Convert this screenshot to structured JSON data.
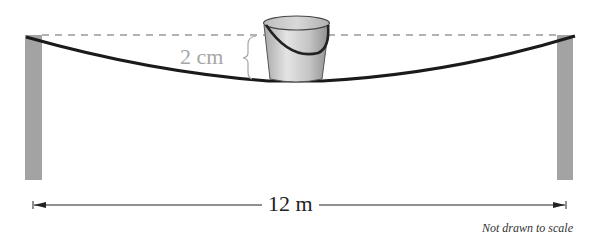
{
  "diagram": {
    "sag_label": "2 cm",
    "span_label": "12 m",
    "note": "Not drawn to scale",
    "objects": [
      "left-post",
      "right-post",
      "rope",
      "bucket",
      "reference-dashed-line",
      "sag-brace",
      "span-dimension-arrow"
    ],
    "colors": {
      "post": "#a3a3a3",
      "rope": "#1a1a1a",
      "dashed_line": "#9a9a9a",
      "sag_label": "#a6a6a6",
      "bucket_light": "#e6e6e6",
      "bucket_dark": "#8c8c8c",
      "arrow": "#222222"
    }
  }
}
